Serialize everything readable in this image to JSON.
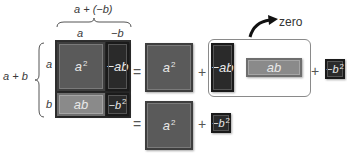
{
  "labels": {
    "top_sum": "a + (−b)",
    "top_a": "a",
    "top_neg_b": "−b",
    "left_sum": "a + b",
    "left_a": "a",
    "left_b": "b",
    "zero": "zero"
  },
  "grid_tiles": [
    {
      "id": "a2",
      "text": "a",
      "sup": "2",
      "kind": "positive-square"
    },
    {
      "id": "neg-ab",
      "text": "−ab",
      "sup": "",
      "kind": "negative-rect"
    },
    {
      "id": "ab",
      "text": "ab",
      "sup": "",
      "kind": "positive-rect"
    },
    {
      "id": "neg-b2",
      "text": "−b",
      "sup": "2",
      "kind": "negative-square"
    }
  ],
  "row1": {
    "equals": "=",
    "a2": {
      "text": "a",
      "sup": "2"
    },
    "plus1": "+",
    "zero_pair": [
      {
        "text": "−ab"
      },
      {
        "text": "ab"
      }
    ],
    "plus2": "+",
    "neg_b2": {
      "text": "−b",
      "sup": "2"
    }
  },
  "row2": {
    "equals": "=",
    "a2": {
      "text": "a",
      "sup": "2"
    },
    "plus": "+",
    "neg_b2": {
      "text": "−b",
      "sup": "2"
    }
  },
  "colors": {
    "positive_square": "#5a5a5a",
    "positive_rect": "#8a8a8a",
    "negative": "#2a2a2a",
    "text": "#3a3a3a"
  }
}
